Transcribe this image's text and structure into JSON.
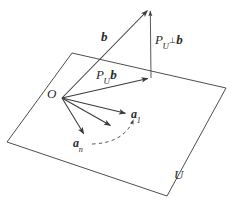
{
  "figure": {
    "background_color": "#ffffff",
    "stroke_color": "#3a3a3a",
    "label_color": "#2b2b2b",
    "plane": {
      "name": "U",
      "label": "U",
      "corners": [
        [
          72,
          53
        ],
        [
          226,
          88
        ],
        [
          167,
          196
        ],
        [
          7,
          142
        ]
      ]
    },
    "points": {
      "origin_label": "O",
      "origin_xy": [
        62,
        98
      ],
      "b_tip_xy": [
        150,
        8
      ],
      "projection_tip_xy": [
        151,
        78
      ]
    },
    "vectors": [
      {
        "name": "b",
        "label_plain": "b",
        "label_base": "b",
        "label_sub": "",
        "from": [
          62,
          98
        ],
        "to": [
          150,
          8
        ],
        "style": "solid",
        "bold_label": true
      },
      {
        "name": "pu-b",
        "label_plain": "P_U b",
        "label_base": "P",
        "label_sub": "U",
        "label_tail": "b",
        "from": [
          62,
          98
        ],
        "to": [
          151,
          78
        ],
        "style": "solid",
        "bold_label": true
      },
      {
        "name": "puperp-b",
        "label_plain": "P_{U⊥} b",
        "label_base": "P",
        "label_sub": "U",
        "label_sub_perp": "⊥",
        "label_tail": "b",
        "from": [
          151,
          78
        ],
        "to": [
          150,
          8
        ],
        "style": "solid",
        "bold_label": true
      },
      {
        "name": "a1",
        "label_plain": "a₁",
        "label_base": "a",
        "label_sub": "1",
        "from": [
          62,
          98
        ],
        "to": [
          128,
          114
        ],
        "style": "solid",
        "bold_label": true
      },
      {
        "name": "a-middle",
        "label_plain": "",
        "from": [
          62,
          98
        ],
        "to": [
          113,
          127
        ],
        "style": "solid",
        "bold_label": false
      },
      {
        "name": "an",
        "label_plain": "aₙ",
        "label_base": "a",
        "label_sub": "n",
        "from": [
          62,
          98
        ],
        "to": [
          85,
          136
        ],
        "style": "solid",
        "bold_label": true
      }
    ],
    "arc": {
      "name": "basis-ellipsis-arc",
      "style": "dashed",
      "from": [
        92,
        143
      ],
      "to": [
        135,
        118
      ],
      "control": [
        122,
        142
      ]
    },
    "labels": {
      "b": "b",
      "pu_b": "P",
      "pu_b_sub": "U",
      "pu_b_tail": "b",
      "puperp_b": "P",
      "puperp_b_sub": "U",
      "puperp_b_perp": "⊥",
      "puperp_b_tail": "b",
      "origin": "O",
      "a1": "a",
      "a1_sub": "1",
      "an": "a",
      "an_sub": "n",
      "plane": "U"
    }
  }
}
